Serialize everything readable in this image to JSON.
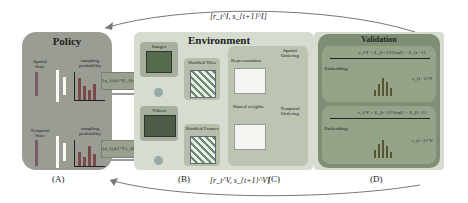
{
  "top_feedback": {
    "label": "[r_t^I, s_{t+1}^I]"
  },
  "bottom_feedback": {
    "label": "[r_t^V, s_{t+1}^V]"
  },
  "policy": {
    "title": "Policy",
    "spatial_state": "Spatial State",
    "temporal_state": "Temporal State",
    "sampling_probability_top": "sampling probability",
    "sampling_probability_bottom": "sampling probability",
    "action_top": "{a_{t,k}^I}_{k=1}^K",
    "action_bottom": "{a_{t,k}^V}_{k=1}^K",
    "caption": "(A)"
  },
  "environment": {
    "title": "Environment",
    "images_label": "Images",
    "videos_label": "Videos",
    "shuffled_tiles_label": "Shuffled Tiles",
    "shuffled_frames_label": "Shuffled Frames",
    "representation_label": "Representation",
    "shared_weights_label": "Shared weights",
    "spatial_ordering_label": "Spatial Ordering",
    "temporal_ordering_label": "Temporal Ordering",
    "caption_b": "(B)",
    "caption_c": "(C)"
  },
  "validation": {
    "title": "Validation",
    "eq_top": "r_t^I = L_{t+1}^{val} − L_{t+1}",
    "eq_bottom": "r_t^V = L_{t+1}^{val} − L_{t+1}",
    "embedding": "Embedding",
    "state_top": "s_{t+1}^I",
    "state_bottom": "s_{t+1}^V",
    "caption": "(D)"
  },
  "colors": {
    "policy_bg": "#9a9d94",
    "environment_bg": "#d6dccf",
    "validation_bg": "#7f8f75",
    "validation_inner": "#95a389",
    "arrow": "#6f6f6f"
  }
}
